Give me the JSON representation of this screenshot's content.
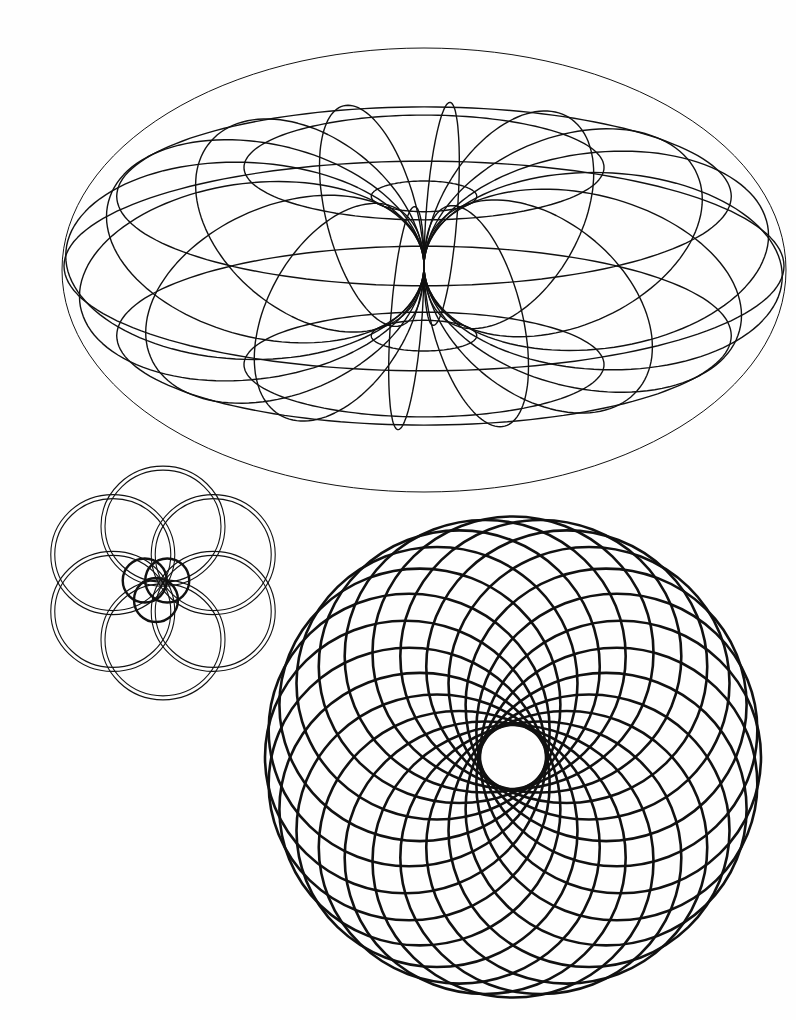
{
  "page": {
    "background": "#fefefe",
    "ink": "#111111",
    "description": "Coloring page with geometric line art"
  },
  "figures": {
    "torus": {
      "label": "Wireframe torus",
      "cx": 424,
      "cy": 266,
      "major_radius": 180,
      "tube_radius": 180,
      "tilt_deg": 62,
      "meridians": 16,
      "parallels": 8,
      "stroke_width": 1.4
    },
    "knot": {
      "label": "Interlaced ring knot",
      "cx": 163,
      "cy": 583,
      "ring_count": 6,
      "ring_rx": 62,
      "ring_ry": 60,
      "ring_offset": 58,
      "band_gap": 4,
      "stroke_width": 1.1,
      "trefoil": {
        "cx": 156,
        "cy": 587,
        "circle_r": 22,
        "offset": 13,
        "stroke_width": 2.4
      }
    },
    "spirograph": {
      "label": "Circle rosette",
      "cx": 513,
      "cy": 757,
      "circle_count": 24,
      "inner_hole_r": 33,
      "outer_r": 248,
      "y_scale": 0.97,
      "stroke_width": 2.6
    }
  }
}
